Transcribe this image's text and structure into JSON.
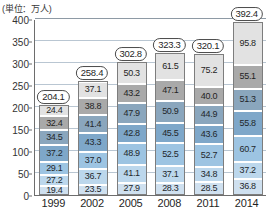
{
  "chart_data": {
    "type": "bar",
    "title": "",
    "subtitle": "",
    "unit_label": "(単位：万人)",
    "xlabel": "",
    "ylabel": "",
    "ylim": [
      0,
      400
    ],
    "yticks": [
      0,
      50,
      100,
      150,
      200,
      250,
      300,
      350,
      400
    ],
    "grid": true,
    "legend": "none",
    "stacked": true,
    "categories": [
      "1999",
      "2002",
      "2005",
      "2008",
      "2011",
      "2014"
    ],
    "totals": [
      204.1,
      258.4,
      302.8,
      323.3,
      320.1,
      392.4
    ],
    "series": [
      {
        "name": "segment-1",
        "color": "#cfe0ef",
        "values": [
          19.4,
          23.5,
          27.9,
          28.3,
          28.5,
          36.8
        ]
      },
      {
        "name": "segment-2",
        "color": "#bcd7ec",
        "values": [
          27.2,
          36.7,
          41.1,
          37.1,
          34.8,
          37.2
        ]
      },
      {
        "name": "segment-3",
        "color": "#9dc4e2",
        "values": [
          29.1,
          37.0,
          48.9,
          52.5,
          52.7,
          60.7
        ]
      },
      {
        "name": "segment-4",
        "color": "#7ea7c9",
        "values": [
          37.2,
          43.3,
          42.8,
          45.5,
          43.6,
          55.8
        ]
      },
      {
        "name": "segment-5",
        "color": "#8aa6bd",
        "values": [
          34.5,
          41.4,
          47.9,
          50.9,
          44.9,
          51.3
        ]
      },
      {
        "name": "segment-6",
        "color": "#a9a9a9",
        "values": [
          32.4,
          38.8,
          43.2,
          47.1,
          40.0,
          55.1
        ]
      },
      {
        "name": "segment-7",
        "color": "#e2e2e2",
        "values": [
          24.4,
          37.1,
          50.3,
          61.5,
          75.2,
          95.8
        ]
      }
    ]
  }
}
